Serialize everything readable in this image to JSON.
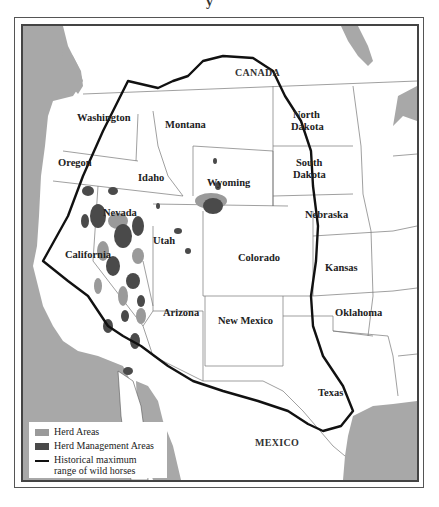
{
  "title_fragment": "y",
  "map": {
    "colors": {
      "water": "#a8a8a8",
      "land": "#ffffff",
      "herd_areas": "#9a9a9a",
      "herd_management_areas": "#4a4a4a",
      "historical_range_line": "#111111",
      "state_borders": "#666666"
    },
    "country_labels": {
      "canada": "CANADA",
      "mexico": "MEXICO"
    },
    "state_labels": {
      "washington": "Washington",
      "oregon": "Oregon",
      "california": "California",
      "idaho": "Idaho",
      "nevada": "Nevada",
      "montana": "Montana",
      "wyoming": "Wyoming",
      "utah": "Utah",
      "arizona": "Arizona",
      "colorado": "Colorado",
      "new_mexico": "New Mexico",
      "north_dakota_1": "North",
      "north_dakota_2": "Dakota",
      "south_dakota_1": "South",
      "south_dakota_2": "Dakota",
      "nebraska": "Nebraska",
      "kansas": "Kansas",
      "oklahoma": "Oklahoma",
      "texas": "Texas"
    }
  },
  "legend": {
    "items": [
      {
        "label": "Herd Areas",
        "type": "swatch",
        "color": "#9a9a9a"
      },
      {
        "label": "Herd Management Areas",
        "type": "swatch",
        "color": "#4a4a4a"
      },
      {
        "label": "Historical maximum range of wild horses",
        "type": "line",
        "color": "#111111"
      }
    ]
  }
}
